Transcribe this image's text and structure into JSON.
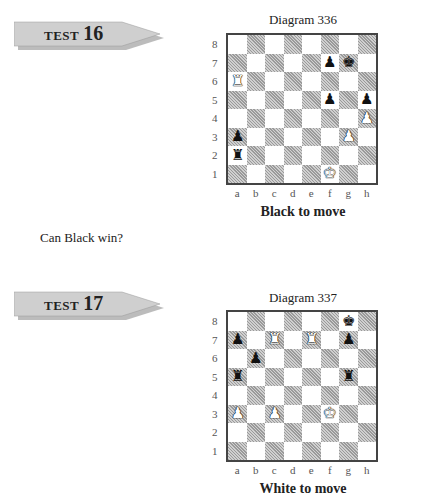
{
  "tests": [
    {
      "label": "TEST",
      "number": "16",
      "diagram": "Diagram 336",
      "to_move": "Black to move",
      "question": "Can Black win?",
      "pieces": {
        "a6": "wR",
        "h4": "wP",
        "g3": "wP",
        "f1": "wK",
        "f7": "bP",
        "g7": "bK",
        "f5": "bP",
        "h5": "bP",
        "a3": "bP",
        "a2": "bR"
      }
    },
    {
      "label": "TEST",
      "number": "17",
      "diagram": "Diagram 337",
      "to_move": "White to move",
      "question": "",
      "pieces": {
        "g8": "bK",
        "a7": "bP",
        "g7": "bP",
        "b6": "bP",
        "a5": "bR",
        "g5": "bR",
        "c7": "wR",
        "e7": "wR",
        "a3": "wP",
        "c3": "wP",
        "f3": "wK"
      }
    }
  ],
  "files": [
    "a",
    "b",
    "c",
    "d",
    "e",
    "f",
    "g",
    "h"
  ],
  "ranks": [
    "8",
    "7",
    "6",
    "5",
    "4",
    "3",
    "2",
    "1"
  ],
  "glyphs": {
    "K": "♚",
    "Q": "♛",
    "R": "♜",
    "B": "♝",
    "N": "♞",
    "P": "♟"
  }
}
